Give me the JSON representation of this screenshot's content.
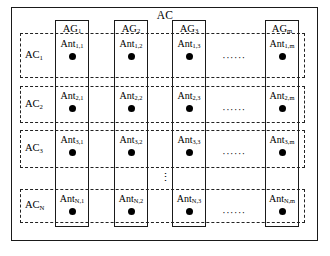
{
  "diagram": {
    "type": "antenna-array-block-diagram",
    "outer_container_label": "AC",
    "antenna_groups": [
      {
        "id": "ag1",
        "label": "AG₁",
        "label_base": "AG",
        "label_sub": "1"
      },
      {
        "id": "ag2",
        "label": "AG₂",
        "label_base": "AG",
        "label_sub": "2"
      },
      {
        "id": "ag3",
        "label": "AG₃",
        "label_base": "AG",
        "label_sub": "3"
      },
      {
        "id": "agm",
        "label": "AGₘ",
        "label_base": "AG",
        "label_sub": "m"
      }
    ],
    "antenna_clusters": [
      {
        "id": "ac1",
        "label_base": "AC",
        "label_sub": "1"
      },
      {
        "id": "ac2",
        "label_base": "AC",
        "label_sub": "2"
      },
      {
        "id": "ac3",
        "label_base": "AC",
        "label_sub": "3"
      },
      {
        "id": "acn",
        "label_base": "AC",
        "label_sub": "N"
      }
    ],
    "antennas": [
      [
        {
          "base": "Ant",
          "sub": "1,1"
        },
        {
          "base": "Ant",
          "sub": "1,2"
        },
        {
          "base": "Ant",
          "sub": "1,3"
        },
        {
          "base": "Ant",
          "sub": "1,m"
        }
      ],
      [
        {
          "base": "Ant",
          "sub": "2,1"
        },
        {
          "base": "Ant",
          "sub": "2,2"
        },
        {
          "base": "Ant",
          "sub": "2,3"
        },
        {
          "base": "Ant",
          "sub": "2,m"
        }
      ],
      [
        {
          "base": "Ant",
          "sub": "3,1"
        },
        {
          "base": "Ant",
          "sub": "3,2"
        },
        {
          "base": "Ant",
          "sub": "3,3"
        },
        {
          "base": "Ant",
          "sub": "3,m"
        }
      ],
      [
        {
          "base": "Ant",
          "sub": "N,1"
        },
        {
          "base": "Ant",
          "sub": "N,2"
        },
        {
          "base": "Ant",
          "sub": "N,3"
        },
        {
          "base": "Ant",
          "sub": "N,m"
        }
      ]
    ],
    "horizontal_ellipsis": "······",
    "vertical_ellipsis": "⋮",
    "colors": {
      "stroke": "#1a1a1a",
      "dashed_stroke": "#222222",
      "dot": "#000000",
      "background": "#ffffff"
    }
  }
}
